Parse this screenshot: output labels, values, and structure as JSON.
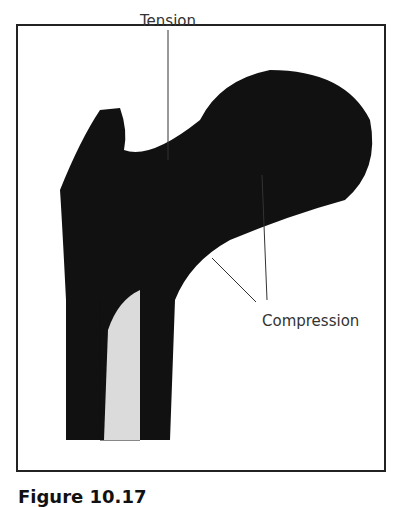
{
  "figure": {
    "labels": {
      "tension": "Tension",
      "compression": "Compression"
    },
    "caption": "Figure 10.17"
  }
}
